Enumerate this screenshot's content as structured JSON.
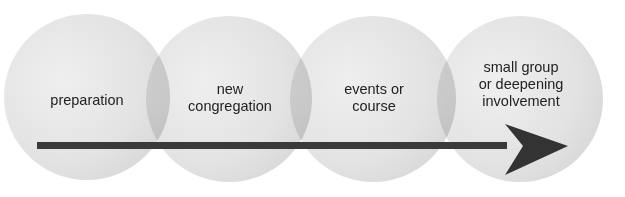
{
  "diagram": {
    "type": "process-flow",
    "stages": [
      {
        "label": "preparation"
      },
      {
        "label_line1": "new",
        "label_line2": "congregation"
      },
      {
        "label_line1": "events or",
        "label_line2": "course"
      },
      {
        "label_line1": "small group",
        "label_line2": "or deepening",
        "label_line3": "involvement"
      }
    ],
    "colors": {
      "circle": "#dcdcdc",
      "arrow": "#3a3a3a",
      "text": "#222222"
    }
  }
}
